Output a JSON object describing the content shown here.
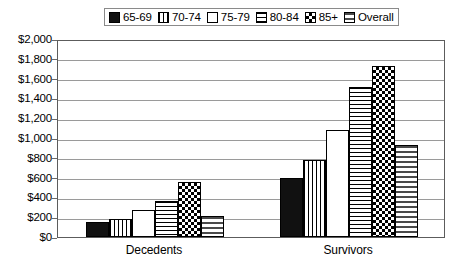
{
  "chart_data": {
    "type": "bar",
    "title": "",
    "subtitle": "",
    "xlabel": "",
    "ylabel": "",
    "categories": [
      "Decedents",
      "Survivors"
    ],
    "series": [
      {
        "name": "65-69",
        "pattern": "solid-black",
        "values": [
          150,
          600
        ]
      },
      {
        "name": "70-74",
        "pattern": "vertical-lines",
        "values": [
          180,
          780
        ]
      },
      {
        "name": "75-79",
        "pattern": "white-empty",
        "values": [
          270,
          1080
        ]
      },
      {
        "name": "80-84",
        "pattern": "horizontal-lines",
        "values": [
          360,
          1520
        ]
      },
      {
        "name": "85+",
        "pattern": "checkerboard",
        "values": [
          560,
          1730
        ]
      },
      {
        "name": "Overall",
        "pattern": "sparse-dots",
        "values": [
          210,
          930
        ]
      }
    ],
    "ylim": [
      0,
      2000
    ],
    "ytick_step": 200,
    "ytick_labels": [
      "$2,000",
      "$1,800",
      "$1,600",
      "$1,400",
      "$1,200",
      "$1,000",
      "$800",
      "$600",
      "$400",
      "$200",
      "$0"
    ],
    "ytick_values": [
      2000,
      1800,
      1600,
      1400,
      1200,
      1000,
      800,
      600,
      400,
      200,
      0
    ],
    "grid": true,
    "legend_position": "top-center",
    "colors": {
      "axis": "#5c5c5c",
      "gridline": "#9a9a9a",
      "bar_outline": "#000000",
      "background": "#ffffff",
      "text": "#000000"
    }
  },
  "legend": {
    "entries": [
      {
        "label": "65-69"
      },
      {
        "label": "70-74"
      },
      {
        "label": "75-79"
      },
      {
        "label": "80-84"
      },
      {
        "label": "85+"
      },
      {
        "label": "Overall"
      }
    ]
  },
  "axis": {
    "y_labels": [
      "$2,000",
      "$1,800",
      "$1,600",
      "$1,400",
      "$1,200",
      "$1,000",
      "$800",
      "$600",
      "$400",
      "$200",
      "$0"
    ],
    "x_labels": [
      "Decedents",
      "Survivors"
    ]
  }
}
